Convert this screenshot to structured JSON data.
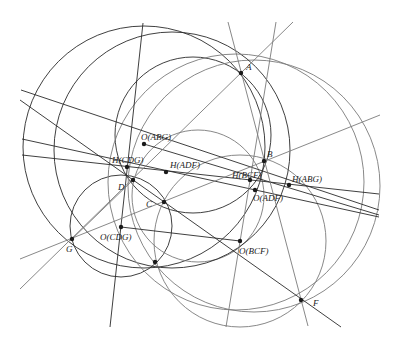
{
  "colors": {
    "dark": "#2a2a2a",
    "gray": "#7a7a7a",
    "point": "#1a1a1a",
    "background": "#ffffff"
  },
  "points": [
    {
      "id": "A",
      "label": "A",
      "x": 241,
      "y": 73,
      "lx": 246,
      "ly": 70
    },
    {
      "id": "B",
      "label": "B",
      "x": 264,
      "y": 161,
      "lx": 267,
      "ly": 157
    },
    {
      "id": "C",
      "label": "C",
      "x": 164,
      "y": 202,
      "lx": 146,
      "ly": 207
    },
    {
      "id": "D",
      "label": "D",
      "x": 133,
      "y": 180,
      "lx": 118,
      "ly": 190
    },
    {
      "id": "F",
      "label": "F",
      "x": 301,
      "y": 300,
      "lx": 313,
      "ly": 306
    },
    {
      "id": "G",
      "label": "G",
      "x": 72,
      "y": 239,
      "lx": 66,
      "ly": 252
    },
    {
      "id": "OABG",
      "label": "O(ABG)",
      "x": 144,
      "y": 144,
      "lx": 141,
      "ly": 140
    },
    {
      "id": "HCDG",
      "label": "H(CDG)",
      "x": 127,
      "y": 167,
      "lx": 112,
      "ly": 163
    },
    {
      "id": "HADF",
      "label": "H(ADF)",
      "x": 166,
      "y": 172,
      "lx": 170,
      "ly": 168
    },
    {
      "id": "HBCF",
      "label": "H(BCF)",
      "x": 250,
      "y": 180,
      "lx": 232,
      "ly": 178
    },
    {
      "id": "HABG",
      "label": "H(ABG)",
      "x": 289,
      "y": 185,
      "lx": 292,
      "ly": 182
    },
    {
      "id": "OADF",
      "label": "O(ADF)",
      "x": 255,
      "y": 190,
      "lx": 253,
      "ly": 201
    },
    {
      "id": "OBCF",
      "label": "O(BCF)",
      "x": 240,
      "y": 241,
      "lx": 239,
      "ly": 254
    },
    {
      "id": "OCDG",
      "label": "O(CDG)",
      "x": 121,
      "y": 227,
      "lx": 100,
      "ly": 240
    },
    {
      "id": "X",
      "label": "",
      "x": 155,
      "y": 262,
      "lx": 0,
      "ly": 0
    }
  ],
  "circles": [
    {
      "name": "circle-abg",
      "cx": 144,
      "cy": 147,
      "r": 121,
      "tone": "dark"
    },
    {
      "name": "circle-abd",
      "cx": 193,
      "cy": 135,
      "r": 78,
      "tone": "dark"
    },
    {
      "name": "circle-cdg",
      "cx": 121,
      "cy": 226,
      "r": 51,
      "tone": "dark"
    },
    {
      "name": "circle-adf",
      "cx": 254,
      "cy": 186,
      "r": 126,
      "tone": "gray"
    },
    {
      "name": "circle-bcf",
      "cx": 240,
      "cy": 241,
      "r": 86,
      "tone": "gray"
    },
    {
      "name": "circle-mid",
      "cx": 198,
      "cy": 196,
      "r": 66,
      "tone": "gray"
    },
    {
      "name": "circle-gxb",
      "cx": 172,
      "cy": 150,
      "r": 118,
      "tone": "dark"
    },
    {
      "name": "circle-dxf",
      "cx": 236,
      "cy": 182,
      "r": 128,
      "tone": "gray"
    }
  ],
  "lines": [
    {
      "name": "line-euler-1",
      "x1": 21,
      "y1": 90,
      "x2": 379,
      "y2": 210,
      "tone": "dark"
    },
    {
      "name": "line-euler-2",
      "x1": 22,
      "y1": 155,
      "x2": 379,
      "y2": 194,
      "tone": "dark"
    },
    {
      "name": "line-euler-3",
      "x1": 22,
      "y1": 139,
      "x2": 379,
      "y2": 217,
      "tone": "dark"
    },
    {
      "name": "line-oabg",
      "x1": 144,
      "y1": 144,
      "x2": 379,
      "y2": 215,
      "tone": "dark"
    },
    {
      "name": "line-steep-left",
      "x1": 143,
      "y1": 23,
      "x2": 110,
      "y2": 327,
      "tone": "dark"
    },
    {
      "name": "line-g-a",
      "x1": 20,
      "y1": 289,
      "x2": 293,
      "y2": 22,
      "tone": "gray"
    },
    {
      "name": "line-g-b",
      "x1": 20,
      "y1": 259,
      "x2": 380,
      "y2": 115,
      "tone": "gray"
    },
    {
      "name": "line-d-f",
      "x1": 20,
      "y1": 100,
      "x2": 341,
      "y2": 327,
      "tone": "dark"
    },
    {
      "name": "line-a-f",
      "x1": 228,
      "y1": 22,
      "x2": 308,
      "y2": 326,
      "tone": "gray"
    },
    {
      "name": "line-b-obcf",
      "x1": 276,
      "y1": 22,
      "x2": 226,
      "y2": 327,
      "tone": "gray"
    },
    {
      "name": "line-ocdg-obcf",
      "x1": 121,
      "y1": 227,
      "x2": 240,
      "y2": 241,
      "tone": "dark"
    },
    {
      "name": "line-d-g",
      "x1": 133,
      "y1": 180,
      "x2": 72,
      "y2": 239,
      "tone": "gray"
    }
  ]
}
